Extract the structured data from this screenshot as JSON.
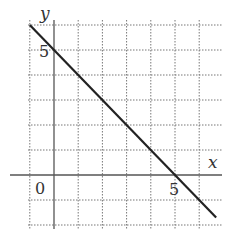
{
  "chart_data": {
    "type": "line",
    "title": "",
    "xlabel": "x",
    "ylabel": "y",
    "xlim": [
      -1,
      6
    ],
    "ylim": [
      -2,
      6
    ],
    "grid": true,
    "grid_style": "dotted",
    "x_ticks": [
      {
        "value": 0,
        "label": "0"
      },
      {
        "value": 5,
        "label": "5"
      }
    ],
    "y_ticks": [
      {
        "value": 5,
        "label": "5"
      }
    ],
    "series": [
      {
        "name": "y = 5 - x",
        "x": [
          -1,
          6.7
        ],
        "y": [
          6,
          -1.7
        ],
        "color": "#222222"
      }
    ]
  },
  "labels": {
    "x_axis": "x",
    "y_axis": "y",
    "origin": "0",
    "x_tick_5": "5",
    "y_tick_5": "5"
  }
}
